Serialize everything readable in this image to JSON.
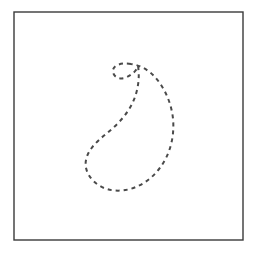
{
  "figure": {
    "canvas": {
      "width": 258,
      "height": 254,
      "background": "#ffffff"
    },
    "frame": {
      "name": "square-border",
      "x": 14,
      "y": 12,
      "width": 229,
      "height": 228,
      "stroke": "#3a3a3a",
      "stroke_width": 1.4,
      "fill": "none"
    },
    "curve": {
      "name": "dashed-paisley-curve",
      "kind": "closed-curve",
      "stroke": "#4a4a4a",
      "stroke_width": 2.0,
      "fill": "none",
      "dash_pattern": "4 4",
      "linecap": "butt",
      "bounds": {
        "left": 85,
        "top": 62,
        "right": 172,
        "bottom": 191
      },
      "path": "M 131 64 C 120 62 112 66 113 72 C 114 78 121 80 127 77 C 133 74 137 70 138 66 C 140 78 138 92 132 104 C 126 116 116 126 106 134 C 96 142 88 150 86 160 C 84 170 90 180 100 186 C 110 192 124 192 136 187 C 148 182 159 172 166 158 C 173 144 175 127 172 112 C 169 97 162 84 153 75 C 147 69 139 65 131 64 Z",
      "points_of_interest": [
        {
          "label": "hook-tip",
          "x": 113,
          "y": 72
        },
        {
          "label": "top",
          "x": 131,
          "y": 63
        },
        {
          "label": "leftmost",
          "x": 85,
          "y": 161
        },
        {
          "label": "bottom",
          "x": 118,
          "y": 190
        },
        {
          "label": "rightmost",
          "x": 172,
          "y": 118
        }
      ]
    }
  }
}
